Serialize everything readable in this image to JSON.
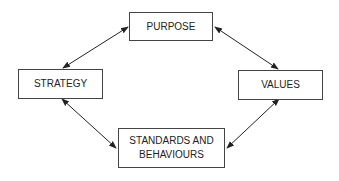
{
  "nodes": {
    "purpose": "PURPOSE",
    "strategy": "STRATEGY",
    "values": "VALUES",
    "standards_line1": "STANDARDS AND",
    "standards_line2": "BEHAVIOURS"
  }
}
